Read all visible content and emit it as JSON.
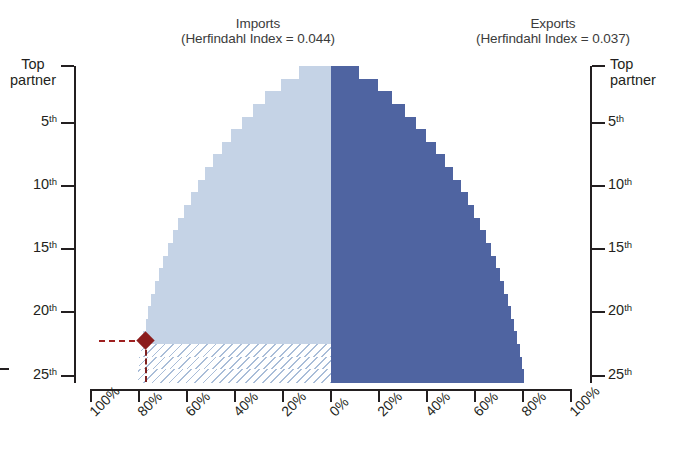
{
  "titles": {
    "imports": {
      "line1": "Imports",
      "line2": "(Herfindahl Index = 0.044)"
    },
    "exports": {
      "line1": "Exports",
      "line2": "(Herfindahl Index = 0.037)"
    }
  },
  "axes": {
    "left_top_label": {
      "line1": "Top",
      "line2": "partner"
    },
    "right_top_label": {
      "line1": "Top",
      "line2": "partner"
    },
    "rank_ticks": [
      "5",
      "10",
      "15",
      "20",
      "25"
    ],
    "rank_suffix": "th",
    "x_tick_labels": [
      "100%",
      "80%",
      "60%",
      "40%",
      "20%",
      "0%",
      "20%",
      "40%",
      "60%",
      "80%",
      "100%"
    ]
  },
  "colors": {
    "imports": "#c5d3e6",
    "exports": "#4f64a1",
    "marker": "#8c1d1d",
    "axis": "#231f20",
    "hatch": "#a9bdd8"
  },
  "chart_data": {
    "type": "bar",
    "orientation": "horizontal-bidirectional",
    "xlabel": "",
    "ylabel": "Top partner rank",
    "xlim": [
      -100,
      100
    ],
    "x_tick_labels": [
      "100%",
      "80%",
      "60%",
      "40%",
      "20%",
      "0%",
      "20%",
      "40%",
      "60%",
      "80%",
      "100%"
    ],
    "grid": false,
    "legend": "none",
    "categories": [
      "Top partner",
      "2nd",
      "3rd",
      "4th",
      "5th",
      "6th",
      "7th",
      "8th",
      "9th",
      "10th",
      "11th",
      "12th",
      "13th",
      "14th",
      "15th",
      "16th",
      "17th",
      "18th",
      "19th",
      "20th",
      "21st",
      "22nd",
      "23rd",
      "24th",
      "25th"
    ],
    "series": [
      {
        "name": "Imports",
        "herfindahl_index": 0.044,
        "direction": "left",
        "units": "% cumulative share",
        "values": [
          13.2,
          21.0,
          27.3,
          32.4,
          37.2,
          41.5,
          45.5,
          49.1,
          52.5,
          55.6,
          58.5,
          61.2,
          63.6,
          65.9,
          68.0,
          70.0,
          71.8,
          73.4,
          74.8,
          76.1,
          77.2,
          78.2,
          79.1,
          79.9,
          80.6
        ],
        "annotation": {
          "label": "marker",
          "rank": 22,
          "value": 78.2,
          "note": "diamond marker with dashed guide lines"
        },
        "hatched_from_rank": 23
      },
      {
        "name": "Exports",
        "herfindahl_index": 0.037,
        "direction": "right",
        "units": "% cumulative share",
        "values": [
          11.8,
          19.4,
          25.6,
          30.7,
          35.4,
          39.7,
          43.7,
          47.4,
          50.8,
          54.0,
          56.9,
          59.6,
          62.1,
          64.4,
          66.6,
          68.6,
          70.4,
          72.1,
          73.6,
          75.0,
          76.3,
          77.5,
          78.6,
          79.6,
          80.5
        ]
      }
    ]
  }
}
